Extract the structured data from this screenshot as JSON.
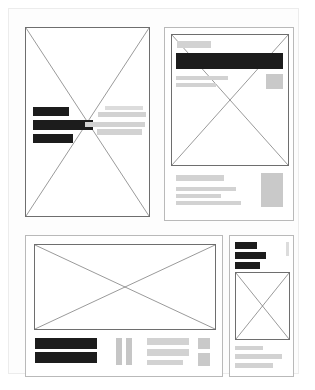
{
  "document": {
    "kind": "wireframe-layout-sheet",
    "page_background": "#fdfdfd",
    "page_border_color": "#ececec",
    "palette": {
      "dark_bar": "#1c1c1c",
      "gray_bar": "#d2d2d2",
      "gray_block": "#c9c9c9",
      "outline": "#6e6e6e",
      "panel_border": "#b9b9b9"
    },
    "panel_count": 4
  },
  "panels": [
    {
      "id": "panel-top-left",
      "label": "Top left portrait placeholder",
      "orientation": "portrait",
      "has_cross_placeholder": true,
      "left_bars": [
        {
          "label": "heading bar",
          "tone": "dark",
          "width_pct": 38
        },
        {
          "label": "title bar",
          "tone": "dark",
          "width_pct": 62
        },
        {
          "label": "subtitle bar",
          "tone": "dark",
          "width_pct": 42
        }
      ],
      "right_bars": [
        {
          "label": "caption line 1",
          "tone": "gray",
          "width_pct": 55
        },
        {
          "label": "caption line 2",
          "tone": "gray",
          "width_pct": 70
        },
        {
          "label": "caption line 3",
          "tone": "gray",
          "width_pct": 62
        },
        {
          "label": "caption line 4",
          "tone": "gray",
          "width_pct": 46
        }
      ]
    },
    {
      "id": "panel-top-right",
      "label": "Top right article placeholder",
      "orientation": "portrait",
      "has_cross_placeholder": true,
      "header_chip": {
        "label": "kicker chip",
        "tone": "gray"
      },
      "banner": {
        "label": "headline banner",
        "tone": "dark"
      },
      "lead_lines": [
        {
          "label": "lead line 1",
          "tone": "gray",
          "width_pct": 68
        },
        {
          "label": "lead line 2",
          "tone": "gray",
          "width_pct": 52
        }
      ],
      "side_block": {
        "label": "side thumbnail",
        "tone": "gray"
      },
      "footer_lines": [
        {
          "label": "footer heading",
          "tone": "gray",
          "width_pct": 62
        },
        {
          "label": "footer line 1",
          "tone": "gray",
          "width_pct": 76
        },
        {
          "label": "footer line 2",
          "tone": "gray",
          "width_pct": 58
        },
        {
          "label": "footer line 3",
          "tone": "gray",
          "width_pct": 82
        }
      ],
      "footer_block": {
        "label": "footer thumbnail",
        "tone": "gray"
      }
    },
    {
      "id": "panel-bottom-left",
      "label": "Bottom left landscape placeholder",
      "orientation": "landscape",
      "has_cross_placeholder": true,
      "content_row": {
        "dark_bars": [
          {
            "label": "caption bar 1",
            "tone": "dark"
          },
          {
            "label": "caption bar 2",
            "tone": "dark"
          }
        ],
        "vertical_bars": [
          {
            "label": "vertical rule 1",
            "tone": "gray"
          },
          {
            "label": "vertical rule 2",
            "tone": "gray"
          }
        ],
        "text_lines": [
          {
            "label": "body line 1",
            "tone": "gray",
            "width_pct": 100
          },
          {
            "label": "body line 2",
            "tone": "gray",
            "width_pct": 100
          },
          {
            "label": "body line 3",
            "tone": "gray",
            "width_pct": 86
          }
        ],
        "side_blocks": [
          {
            "label": "side block top",
            "tone": "gray"
          },
          {
            "label": "side block bottom",
            "tone": "gray"
          }
        ]
      }
    },
    {
      "id": "panel-bottom-right",
      "label": "Bottom right narrow placeholder",
      "orientation": "portrait",
      "has_cross_placeholder": true,
      "header_bars": [
        {
          "label": "label bar 1",
          "tone": "dark",
          "width_pct": 52
        },
        {
          "label": "label bar 2",
          "tone": "dark",
          "width_pct": 74
        },
        {
          "label": "label bar 3",
          "tone": "dark",
          "width_pct": 60
        }
      ],
      "side_strip": {
        "label": "scroll strip",
        "tone": "gray"
      },
      "footer_lines": [
        {
          "label": "note line 1",
          "tone": "gray",
          "width_pct": 52
        },
        {
          "label": "note line 2",
          "tone": "gray",
          "width_pct": 86
        },
        {
          "label": "note line 3",
          "tone": "gray",
          "width_pct": 70
        }
      ]
    }
  ]
}
